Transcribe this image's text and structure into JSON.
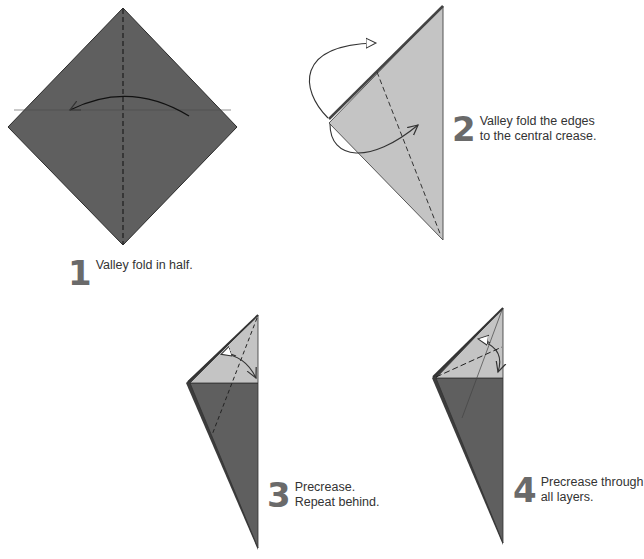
{
  "colors": {
    "dark_paper": "#5f5f5f",
    "light_paper": "#c4c4c4",
    "line": "#333333",
    "step_number": "#6a6a6a",
    "text": "#333333"
  },
  "steps": [
    {
      "number": "1",
      "lines": [
        "Valley fold in half."
      ],
      "diagram": "square-diamond-with-vertical-valley-fold"
    },
    {
      "number": "2",
      "lines": [
        "Valley fold the edges",
        "to the central crease."
      ],
      "diagram": "triangle-with-edge-folds"
    },
    {
      "number": "3",
      "lines": [
        "Precrease.",
        "Repeat behind."
      ],
      "diagram": "kite-precrease"
    },
    {
      "number": "4",
      "lines": [
        "Precrease through",
        "all layers."
      ],
      "diagram": "kite-precrease-through-layers"
    }
  ]
}
